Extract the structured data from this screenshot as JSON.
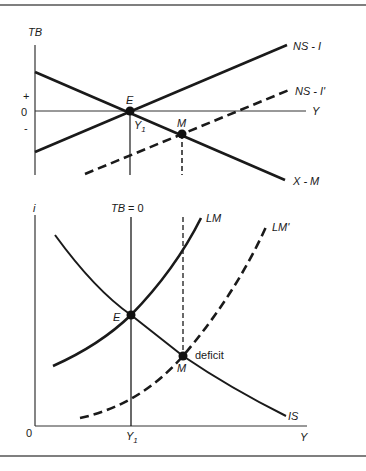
{
  "top_panel": {
    "y_axis_label": "TB",
    "x_axis_label": "Y",
    "tick_plus": "+",
    "tick_zero": "0",
    "tick_minus": "-",
    "point_e": "E",
    "point_m": "M",
    "y1_label": "Y",
    "y1_sub": "1",
    "curves": {
      "ns_i": "NS - I",
      "ns_i_prime": "NS - I'",
      "x_m": "X - M"
    }
  },
  "bottom_panel": {
    "y_axis_label": "i",
    "x_axis_label": "Y",
    "origin_label": "0",
    "y1_label": "Y",
    "y1_sub": "1",
    "tb_zero_label": "TB  = 0",
    "point_e": "E",
    "point_m": "M",
    "deficit_label": "deficit",
    "curves": {
      "lm": "LM",
      "lm_prime": "LM'",
      "is": "IS"
    }
  },
  "colors": {
    "line": "#1a1a1a",
    "axis": "#333333",
    "border": "#555555"
  }
}
